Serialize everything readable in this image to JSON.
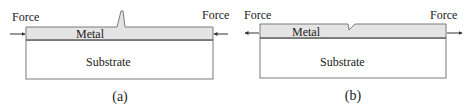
{
  "panels": [
    {
      "id": "a",
      "caption": "(a)",
      "left_force_label": "Force",
      "right_force_label": "Force",
      "metal_label": "Metal",
      "substrate_label": "Substrate",
      "force_direction": "compressive",
      "defect": "peak"
    },
    {
      "id": "b",
      "caption": "(b)",
      "left_force_label": "Force",
      "right_force_label": "Force",
      "metal_label": "Metal",
      "substrate_label": "Substrate",
      "force_direction": "tensile",
      "defect": "notch"
    }
  ],
  "colors": {
    "metal_fill": "#e4e4e4",
    "outline": "#7a7a7a",
    "arrow": "#333333"
  }
}
